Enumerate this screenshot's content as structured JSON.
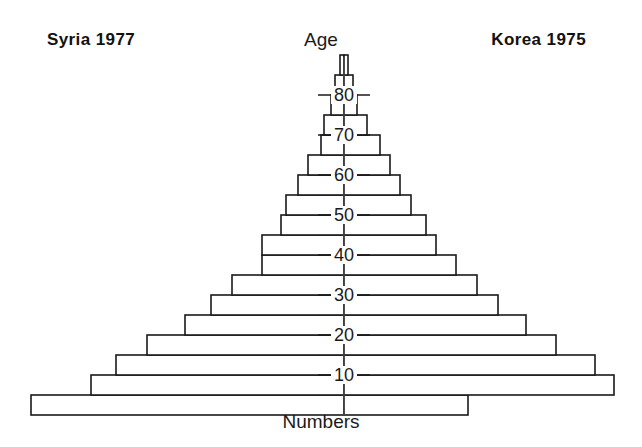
{
  "chart_data": {
    "type": "bar",
    "subtype": "population-pyramid",
    "title": "",
    "xlabel": "Numbers",
    "ylabel": "Age",
    "axis_top_label": "Age",
    "axis_bottom_label": "Numbers",
    "left_series_label": "Syria  1977",
    "right_series_label": "Korea 1975",
    "grid": false,
    "legend_position": "top-corners",
    "categories": [
      "0",
      "5",
      "10",
      "15",
      "20",
      "25",
      "30",
      "35",
      "40",
      "45",
      "50",
      "55",
      "60",
      "65",
      "70",
      "75",
      "80",
      "85"
    ],
    "age_tick_labels": [
      "10",
      "20",
      "30",
      "40",
      "50",
      "60",
      "70",
      "80"
    ],
    "age_ticks": [
      10,
      20,
      30,
      40,
      50,
      60,
      70,
      80
    ],
    "series": [
      {
        "name": "Syria  1977",
        "side": "left",
        "values": [
          313,
          253,
          228,
          197,
          159,
          133,
          112,
          82,
          82,
          63,
          58,
          46,
          36,
          23,
          20,
          13,
          9,
          4
        ]
      },
      {
        "name": "Korea 1975",
        "side": "right",
        "values": [
          124,
          270,
          251,
          212,
          182,
          154,
          133,
          112,
          92,
          82,
          67,
          56,
          46,
          36,
          23,
          13,
          9,
          4
        ]
      }
    ]
  },
  "chart": {
    "axis_top_label": "Age",
    "axis_bottom_label": "Numbers",
    "left_title": "Syria  1977",
    "right_title": "Korea 1975",
    "tick_labels": [
      "80",
      "70",
      "60",
      "50",
      "40",
      "30",
      "20",
      "10"
    ]
  },
  "colors": {
    "background": "#ffffff",
    "stroke": "#1a1a1a",
    "axis": "#555555",
    "text": "#111111"
  }
}
